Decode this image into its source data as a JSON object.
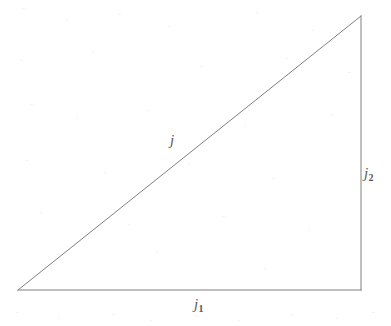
{
  "figure": {
    "kind": "geometry-diagram",
    "shape_name": "right-triangle",
    "background_color": "#ffffff",
    "stroke_color": "#808080",
    "label_color": "#555555",
    "stroke_width": 1,
    "width": 391,
    "height": 326,
    "vertices": {
      "bottom_left": {
        "x": 18,
        "y": 290
      },
      "bottom_right": {
        "x": 361,
        "y": 290
      },
      "top_right": {
        "x": 361,
        "y": 16
      }
    },
    "edges": [
      {
        "name": "hypotenuse",
        "from": "bottom_left",
        "to": "top_right",
        "label_variable": "j",
        "label_subscript": ""
      },
      {
        "name": "vertical-leg",
        "from": "bottom_right",
        "to": "top_right",
        "label_variable": "j",
        "label_subscript": "2"
      },
      {
        "name": "horizontal-leg",
        "from": "bottom_left",
        "to": "bottom_right",
        "label_variable": "j",
        "label_subscript": "1"
      }
    ],
    "labels": {
      "hypotenuse": {
        "variable": "j",
        "subscript": "",
        "x": 175,
        "y": 140
      },
      "vertical_leg": {
        "variable": "j",
        "subscript": "2",
        "x": 370,
        "y": 173
      },
      "horizontal_leg": {
        "variable": "j",
        "subscript": "1",
        "x": 203,
        "y": 304
      }
    }
  }
}
